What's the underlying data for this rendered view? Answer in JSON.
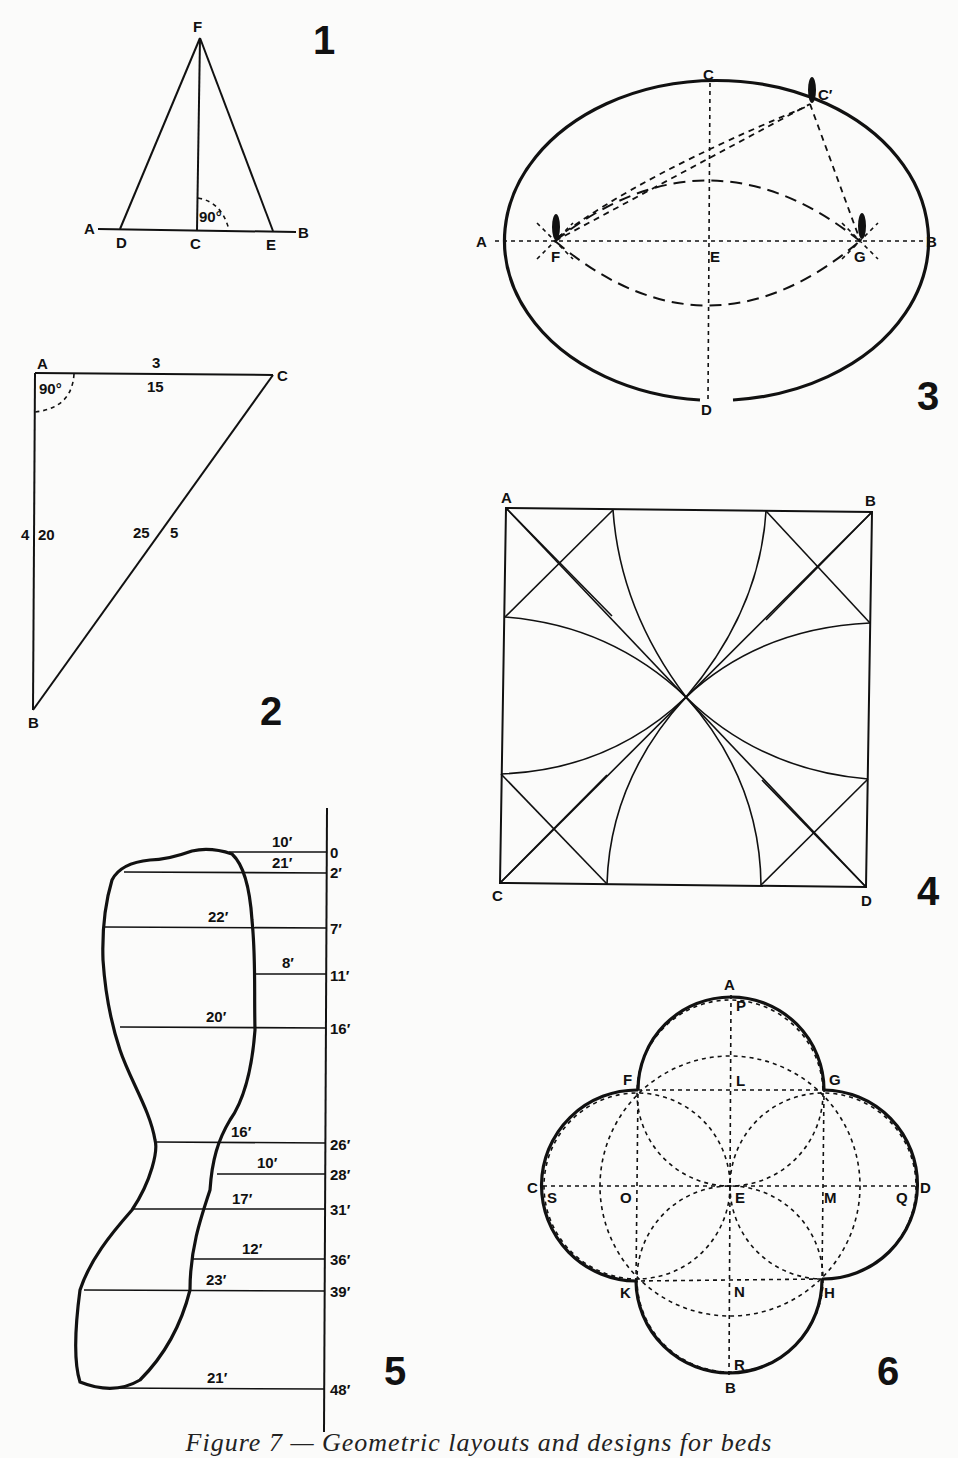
{
  "figures": {
    "fig1": {
      "number": "1",
      "points": {
        "A": "A",
        "B": "B",
        "C": "C",
        "D": "D",
        "E": "E",
        "F": "F"
      },
      "angle": "90°"
    },
    "fig2": {
      "number": "2",
      "points": {
        "A": "A",
        "B": "B",
        "C": "C"
      },
      "angle": "90°",
      "side_AC": {
        "outer": "3",
        "inner": "15"
      },
      "side_AB": {
        "outer": "4",
        "inner": "20"
      },
      "side_BC": {
        "inner": "25",
        "outer": "5"
      }
    },
    "fig3": {
      "number": "3",
      "points": {
        "A": "A",
        "B": "B",
        "C": "C",
        "C_prime": "C′",
        "D": "D",
        "E": "E",
        "F": "F",
        "G": "G"
      }
    },
    "fig4": {
      "number": "4",
      "points": {
        "A": "A",
        "B": "B",
        "C": "C",
        "D": "D"
      }
    },
    "fig5": {
      "number": "5",
      "offsets": [
        {
          "station": "0",
          "width": "10′"
        },
        {
          "station": "2′",
          "width": "21′"
        },
        {
          "station": "7′",
          "width": "22′"
        },
        {
          "station": "11′",
          "width": "8′"
        },
        {
          "station": "16′",
          "width": "20′"
        },
        {
          "station": "26′",
          "width": "16′"
        },
        {
          "station": "28′",
          "width": "10′"
        },
        {
          "station": "31′",
          "width": "17′"
        },
        {
          "station": "36′",
          "width": "12′"
        },
        {
          "station": "39′",
          "width": "23′"
        },
        {
          "station": "48′",
          "width": "21′"
        }
      ]
    },
    "fig6": {
      "number": "6",
      "points": {
        "A": "A",
        "B": "B",
        "C": "C",
        "D": "D",
        "E": "E",
        "F": "F",
        "G": "G",
        "H": "H",
        "K": "K",
        "L": "L",
        "M": "M",
        "N": "N",
        "O": "O",
        "P": "P",
        "Q": "Q",
        "R": "R",
        "S": "S"
      }
    }
  },
  "caption": "Figure 7 — Geometric layouts and designs for beds"
}
